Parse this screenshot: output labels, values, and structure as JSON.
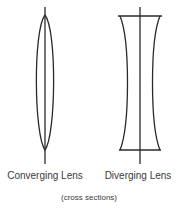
{
  "diagram": {
    "lenses": [
      {
        "id": "converging",
        "label": "Converging Lens",
        "shape": "biconvex"
      },
      {
        "id": "diverging",
        "label": "Diverging Lens",
        "shape": "biconcave"
      }
    ],
    "caption": "(cross sections)",
    "colors": {
      "stroke": "#2a2a2a",
      "text": "#3a3a3a",
      "background": "#ffffff"
    }
  }
}
